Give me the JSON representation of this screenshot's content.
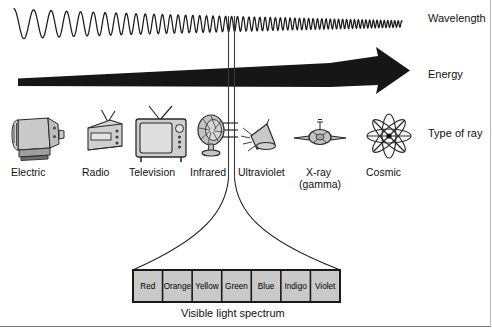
{
  "figure": {
    "caption": "Visible light spectrum"
  },
  "axis_labels": [
    {
      "id": "wavelength",
      "text": "Wavelength",
      "x": 428,
      "y": 18
    },
    {
      "id": "energy",
      "text": "Energy",
      "x": 428,
      "y": 74
    },
    {
      "id": "type-of-ray",
      "text": "Type of ray",
      "x": 428,
      "y": 133
    }
  ],
  "rays": [
    {
      "id": "electric",
      "label": "Electric",
      "sublabel": "",
      "icon": "electric-motor-icon",
      "x": 36,
      "y": 171
    },
    {
      "id": "radio",
      "label": "Radio",
      "sublabel": "",
      "icon": "radio-icon",
      "x": 101,
      "y": 171
    },
    {
      "id": "television",
      "label": "Television",
      "sublabel": "",
      "icon": "television-icon",
      "x": 160,
      "y": 171
    },
    {
      "id": "infrared",
      "label": "Infrared",
      "sublabel": "",
      "icon": "heat-lamp-icon",
      "x": 214,
      "y": 171
    },
    {
      "id": "ultraviolet",
      "label": "Ultraviolet",
      "sublabel": "",
      "icon": "uv-lamp-icon",
      "x": 268,
      "y": 171
    },
    {
      "id": "xray",
      "label": "X-ray",
      "sublabel": "(gamma)",
      "icon": "xray-tube-icon",
      "x": 325,
      "y": 171
    },
    {
      "id": "cosmic",
      "label": "Cosmic",
      "sublabel": "",
      "icon": "cosmic-atom-icon",
      "x": 389,
      "y": 171
    }
  ],
  "visible_spectrum": {
    "caption": "Visible light spectrum",
    "box": {
      "x": 133,
      "y": 270,
      "width": 207,
      "height": 32
    },
    "fill": "#c9c9c9",
    "stroke": "#1a1a1a",
    "bands": [
      {
        "name": "Red"
      },
      {
        "name": "Orange"
      },
      {
        "name": "Yellow"
      },
      {
        "name": "Green"
      },
      {
        "name": "Blue"
      },
      {
        "name": "Indigo"
      },
      {
        "name": "Violet"
      }
    ]
  },
  "wave": {
    "name": "wavelength-wave",
    "description": "sine wave with wavelength decreasing left to right",
    "stroke": "#1a1a1a"
  },
  "energy_arrow": {
    "name": "energy-arrow",
    "description": "tapered wedge arrow widening and pointing right",
    "fill": "#161616"
  },
  "colors": {
    "ink": "#1a1a1a",
    "icon_fill": "#c9c9c9",
    "icon_stroke": "#2a2a2a",
    "background": "#ffffff",
    "frame": "#8a8a8a"
  }
}
